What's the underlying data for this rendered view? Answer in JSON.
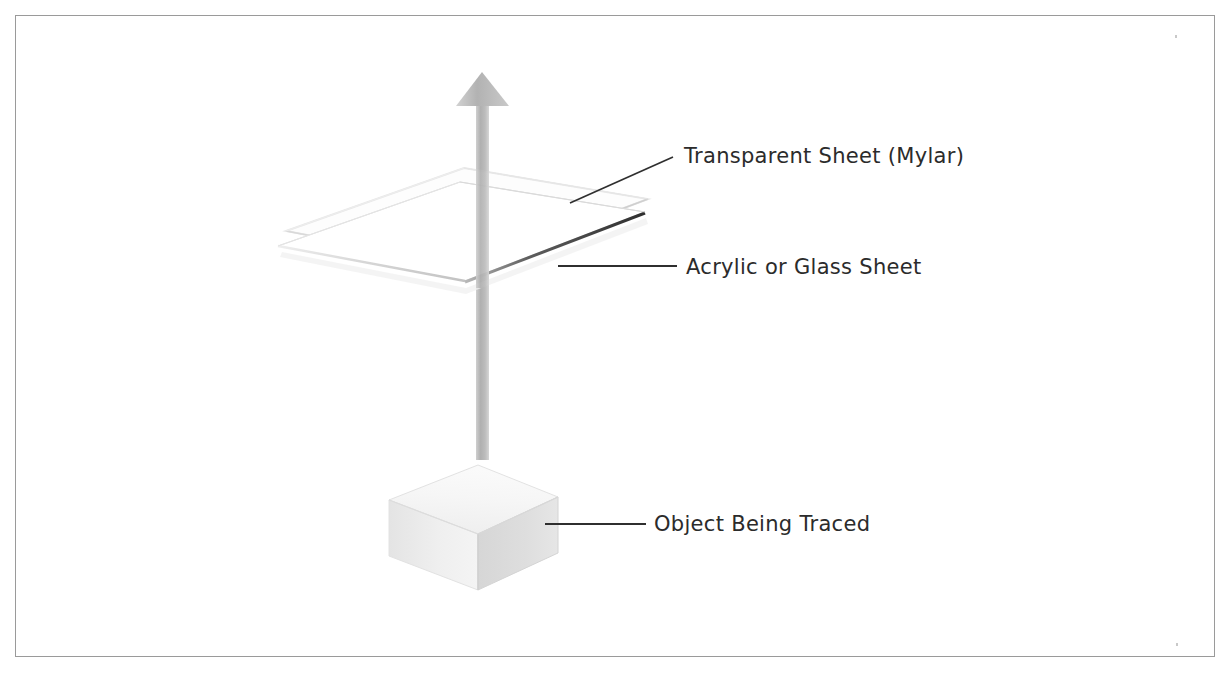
{
  "figure": {
    "type": "technical-illustration",
    "title": "",
    "background_color": "#ffffff",
    "border_color": "#9a9a9a"
  },
  "labels": [
    {
      "id": "mylar",
      "text": "Transparent Sheet (Mylar)",
      "leader": "diagonal",
      "color": "#2b2b2b"
    },
    {
      "id": "acrylic",
      "text": "Acrylic or Glass Sheet",
      "leader": "horizontal",
      "color": "#2b2b2b"
    },
    {
      "id": "object",
      "text": "Object Being Traced",
      "leader": "horizontal",
      "color": "#2b2b2b"
    }
  ],
  "parts": {
    "arrow": {
      "name": "upward-arrow",
      "direction": "up",
      "color": "#b4b4b4",
      "shaft_color": "#bdbdbd"
    },
    "mylar_sheet": {
      "name": "transparent-sheet",
      "material": "Mylar",
      "fill": "#fcfcfc",
      "edge_color": "#d8d8d8"
    },
    "glass_sheet": {
      "name": "acrylic-glass-sheet",
      "material": "Acrylic or Glass",
      "fill": "#ffffff",
      "edge_color": "#3a3a3a"
    },
    "cube": {
      "name": "object-being-traced",
      "top_face": "#f2f2f2",
      "left_face": "#ededed",
      "right_face": "#dcdcdc",
      "edge_color": "#d2d2d2"
    }
  }
}
